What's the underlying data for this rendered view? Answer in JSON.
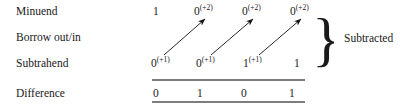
{
  "figure": {
    "ink_color": "#1a1a1a",
    "rule_color": "#7d7d7d",
    "background": "#ffffff"
  },
  "rows": {
    "minuend": {
      "label": "Minuend",
      "cells": [
        {
          "digit": "1",
          "sup": ""
        },
        {
          "digit": "0",
          "sup": "(+2)"
        },
        {
          "digit": "0",
          "sup": "(+2)"
        },
        {
          "digit": "0",
          "sup": "(+2)"
        }
      ]
    },
    "borrow": {
      "label": "Borrow out/in",
      "cells": []
    },
    "subtrahend": {
      "label": "Subtrahend",
      "cells": [
        {
          "digit": "0",
          "sup": "(+1)"
        },
        {
          "digit": "0",
          "sup": "(+1)"
        },
        {
          "digit": "1",
          "sup": "(+1)"
        },
        {
          "digit": "1",
          "sup": ""
        }
      ]
    },
    "difference": {
      "label": "Difference",
      "cells": [
        {
          "digit": "0",
          "sup": ""
        },
        {
          "digit": "1",
          "sup": ""
        },
        {
          "digit": "0",
          "sup": ""
        },
        {
          "digit": "1",
          "sup": ""
        }
      ]
    }
  },
  "annotation": {
    "brace_glyph": "}",
    "note": "Subtracted"
  },
  "arrows": [
    {
      "name": "borrow-arrow-1",
      "x1": 164,
      "y1": 55,
      "x2": 205,
      "y2": 19
    },
    {
      "name": "borrow-arrow-2",
      "x1": 211,
      "y1": 55,
      "x2": 253,
      "y2": 19
    },
    {
      "name": "borrow-arrow-3",
      "x1": 259,
      "y1": 55,
      "x2": 301,
      "y2": 19
    }
  ]
}
